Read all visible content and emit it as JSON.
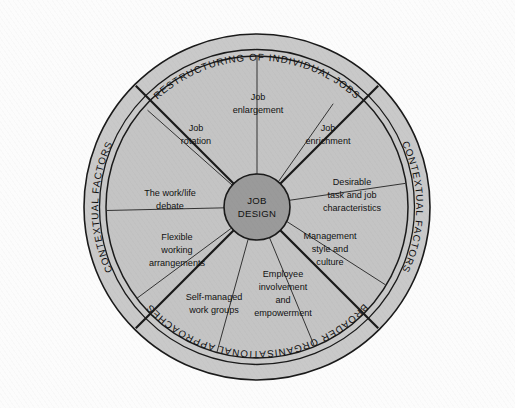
{
  "figure": {
    "background_color": "#fcfcfc",
    "outer_ring_color": "#c9c9c9",
    "inner_disc_color": "#c4c4c4",
    "hub_color": "#9a9a9a",
    "line_color": "#1a1a1a",
    "text_color": "#111111"
  },
  "hub": {
    "line1": "JOB",
    "line2": "DESIGN"
  },
  "outer_ring": {
    "labels": [
      {
        "name": "restructuring-of-individual-jobs",
        "text": "RESTRUCTURING OF INDIVIDUAL JOBS",
        "position": "top"
      },
      {
        "name": "contextual-factors-right",
        "text": "CONTEXTUAL FACTORS",
        "position": "right"
      },
      {
        "name": "broader-organisational-approaches",
        "text": "BROADER ORGANISATIONAL APPROACHES",
        "position": "bottom"
      },
      {
        "name": "contextual-factors-left",
        "text": "CONTEXTUAL FACTORS",
        "position": "left"
      }
    ],
    "top_label": "RESTRUCTURING OF INDIVIDUAL JOBS",
    "bottom_label": "BROADER ORGANISATIONAL APPROACHES",
    "left_label": "CONTEXTUAL FACTORS",
    "right_label": "CONTEXTUAL FACTORS"
  },
  "segments": [
    {
      "id": "job-enlargement",
      "lines": [
        "Job",
        "enlargement"
      ]
    },
    {
      "id": "job-enrichment",
      "lines": [
        "Job",
        "enrichment"
      ]
    },
    {
      "id": "desirable-task-and-job-characteristics",
      "lines": [
        "Desirable",
        "task and job",
        "characteristics"
      ]
    },
    {
      "id": "management-style-and-culture",
      "lines": [
        "Management",
        "style and",
        "culture"
      ]
    },
    {
      "id": "employee-involvement-and-empowerment",
      "lines": [
        "Employee",
        "involvement",
        "and",
        "empowerment"
      ]
    },
    {
      "id": "self-managed-work-groups",
      "lines": [
        "Self-managed",
        "work groups"
      ]
    },
    {
      "id": "flexible-working-arrangements",
      "lines": [
        "Flexible",
        "working",
        "arrangements"
      ]
    },
    {
      "id": "the-work-life-debate",
      "lines": [
        "The work/life",
        "debate"
      ]
    },
    {
      "id": "job-rotation",
      "lines": [
        "Job",
        "rotation"
      ]
    }
  ],
  "seg_text": {
    "job_enlargement_1": "Job",
    "job_enlargement_2": "enlargement",
    "job_enrichment_1": "Job",
    "job_enrichment_2": "enrichment",
    "desirable_1": "Desirable",
    "desirable_2": "task and job",
    "desirable_3": "characteristics",
    "management_1": "Management",
    "management_2": "style and",
    "management_3": "culture",
    "employee_1": "Employee",
    "employee_2": "involvement",
    "employee_3": "and",
    "employee_4": "empowerment",
    "selfmanaged_1": "Self-managed",
    "selfmanaged_2": "work groups",
    "flexible_1": "Flexible",
    "flexible_2": "working",
    "flexible_3": "arrangements",
    "worklife_1": "The work/life",
    "worklife_2": "debate",
    "rotation_1": "Job",
    "rotation_2": "rotation"
  }
}
